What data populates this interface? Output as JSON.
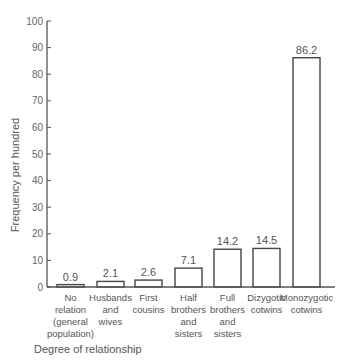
{
  "chart_data": {
    "type": "bar",
    "title": "",
    "xlabel": "Degree of relationship",
    "ylabel": "Frequency per hundred",
    "ylim": [
      0,
      100
    ],
    "yticks": [
      0,
      10,
      20,
      30,
      40,
      50,
      60,
      70,
      80,
      90,
      100
    ],
    "grid": false,
    "legend": null,
    "categories": [
      "No relation (general population)",
      "Husbands and wives",
      "First cousins",
      "Half brothers and sisters",
      "Full brothers and sisters",
      "Dizygotic cotwins",
      "Monozygotic cotwins"
    ],
    "category_lines": [
      [
        "No",
        "relation",
        "(general",
        "population)"
      ],
      [
        "Husbands",
        "and",
        "wives"
      ],
      [
        "First",
        "cousins"
      ],
      [
        "Half",
        "brothers",
        "and",
        "sisters"
      ],
      [
        "Full",
        "brothers",
        "and",
        "sisters"
      ],
      [
        "Dizygotic",
        "cotwins"
      ],
      [
        "Monozygotic",
        "cotwins"
      ]
    ],
    "values": [
      0.9,
      2.1,
      2.6,
      7.1,
      14.2,
      14.5,
      86.2
    ],
    "value_labels": [
      "0.9",
      "2.1",
      "2.6",
      "7.1",
      "14.2",
      "14.5",
      "86.2"
    ]
  },
  "colors": {
    "axis": "#555555",
    "bar_stroke": "#444444",
    "bar_fill": "#ffffff"
  }
}
